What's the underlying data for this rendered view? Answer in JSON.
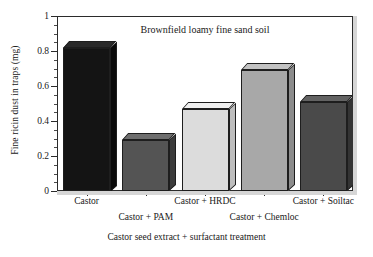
{
  "chart_data": {
    "type": "bar",
    "title": "Brownfield loamy fine sand soil",
    "xlabel": "Castor seed extract + surfactant treatment",
    "ylabel": "Fine ricin dust in traps (mg)",
    "categories": [
      "Castor",
      "Castor + PAM",
      "Castor + HRDC",
      "Castor + Chemloc",
      "Castor + Soiltac"
    ],
    "values": [
      0.82,
      0.29,
      0.47,
      0.69,
      0.51
    ],
    "ylim": [
      0,
      1
    ],
    "ytick_labels": [
      "0",
      "0.2",
      "0.4",
      "0.6",
      "0.8",
      "1"
    ],
    "ytick_values": [
      0,
      0.2,
      0.4,
      0.6,
      0.8,
      1
    ],
    "yminor_step": 0.05,
    "grid": false,
    "legend": "none",
    "bar_colors": [
      "#141414",
      "#545454",
      "#dcdcdc",
      "#a8a8a8",
      "#4a4a4a"
    ],
    "bar_top_colors": [
      "#2a2a2a",
      "#6e6e6e",
      "#f0f0f0",
      "#c2c2c2",
      "#636363"
    ],
    "bar_side_colors": [
      "#0a0a0a",
      "#3c3c3c",
      "#bdbdbd",
      "#8c8c8c",
      "#343434"
    ],
    "style": "3d-bar",
    "background": "#ffffff",
    "axis_color": "#2b2b2b"
  }
}
